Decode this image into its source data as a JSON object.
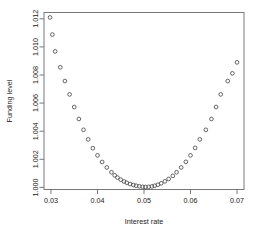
{
  "chart_data": {
    "type": "scatter",
    "title": "",
    "xlabel": "Interest rate",
    "ylabel": "Funding level",
    "xlim": [
      0.0285,
      0.0715
    ],
    "ylim": [
      0.99985,
      1.01245
    ],
    "grid": false,
    "legend": null,
    "marker": "open-circle",
    "marker_color": "#4a4a4a",
    "xticks": [
      "0.03",
      "0.04",
      "0.05",
      "0.06",
      "0.07"
    ],
    "xtick_values": [
      0.03,
      0.04,
      0.05,
      0.06,
      0.07
    ],
    "yticks": [
      "1.000",
      "1.002",
      "1.004",
      "1.006",
      "1.008",
      "1.010",
      "1.012"
    ],
    "ytick_values": [
      1.0,
      1.002,
      1.004,
      1.006,
      1.008,
      1.01,
      1.012
    ],
    "x": [
      0.0298,
      0.0303,
      0.0309,
      0.032,
      0.033,
      0.034,
      0.035,
      0.036,
      0.037,
      0.038,
      0.039,
      0.04,
      0.041,
      0.042,
      0.043,
      0.0437,
      0.0443,
      0.045,
      0.0457,
      0.0463,
      0.047,
      0.0477,
      0.0483,
      0.049,
      0.0497,
      0.0503,
      0.051,
      0.0517,
      0.0523,
      0.053,
      0.0537,
      0.0545,
      0.0553,
      0.0562,
      0.057,
      0.058,
      0.059,
      0.06,
      0.061,
      0.062,
      0.0633,
      0.0645,
      0.0655,
      0.0665,
      0.068,
      0.069,
      0.07
    ],
    "y": [
      1.0121,
      1.01088,
      1.00968,
      1.00855,
      1.00757,
      1.00662,
      1.00572,
      1.00487,
      1.0041,
      1.00342,
      1.00279,
      1.00228,
      1.00181,
      1.00142,
      1.00108,
      1.00086,
      1.0007,
      1.00055,
      1.00042,
      1.00033,
      1.00024,
      1.00017,
      1.00012,
      1.00008,
      1.00004,
      1.00003,
      1.00004,
      1.00007,
      1.00012,
      1.00019,
      1.00029,
      1.00043,
      1.0006,
      1.00082,
      1.00108,
      1.00142,
      1.00182,
      1.00228,
      1.00281,
      1.00342,
      1.0041,
      1.00487,
      1.00572,
      1.00662,
      1.00757,
      1.00812,
      1.0089
    ],
    "series": [
      {
        "name": "Funding level vs interest rate",
        "description": "Convex U-shaped relationship with minimum funding level of approximately 1.0000 near an interest rate of 0.050"
      }
    ],
    "annotations": []
  }
}
